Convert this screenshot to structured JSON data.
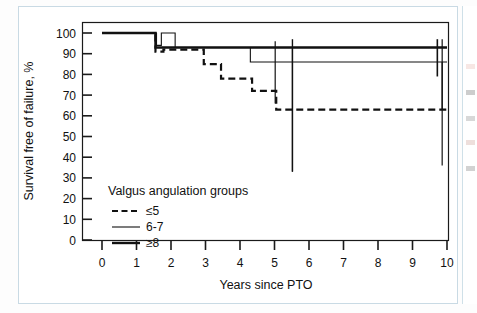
{
  "figure": {
    "name": "kaplan-meier-survival-plot"
  },
  "chart_data": {
    "type": "line",
    "title": "",
    "xlabel": "Years since PTO",
    "ylabel": "Survival free of failure, %",
    "xlim": [
      0,
      10
    ],
    "ylim": [
      0,
      100
    ],
    "xticks": [
      "0",
      "1",
      "2",
      "3",
      "4",
      "5",
      "6",
      "7",
      "8",
      "9",
      "10"
    ],
    "yticks": [
      "0",
      "10",
      "20",
      "30",
      "40",
      "50",
      "60",
      "70",
      "80",
      "90",
      "100"
    ],
    "grid": false,
    "legend_position": "lower-left-inside",
    "legend_title": "Valgus angulation groups",
    "series": [
      {
        "name": "≤5",
        "style": "dashed",
        "line_width": 2.2,
        "color": "#111111",
        "steps": [
          {
            "x": 0.0,
            "y": 100
          },
          {
            "x": 1.55,
            "y": 91
          },
          {
            "x": 1.78,
            "y": 92
          },
          {
            "x": 2.95,
            "y": 85
          },
          {
            "x": 3.45,
            "y": 78
          },
          {
            "x": 4.35,
            "y": 72
          },
          {
            "x": 5.05,
            "y": 63
          },
          {
            "x": 10.0,
            "y": 63
          }
        ]
      },
      {
        "name": "6-7",
        "style": "solid-thin",
        "line_width": 1.1,
        "color": "#111111",
        "steps": [
          {
            "x": 0.0,
            "y": 100
          },
          {
            "x": 1.58,
            "y": 94
          },
          {
            "x": 1.72,
            "y": 100
          },
          {
            "x": 2.12,
            "y": 93
          },
          {
            "x": 4.3,
            "y": 86
          },
          {
            "x": 10.0,
            "y": 86
          }
        ]
      },
      {
        "name": "≥8",
        "style": "solid-thick",
        "line_width": 2.4,
        "color": "#111111",
        "steps": [
          {
            "x": 0.0,
            "y": 100
          },
          {
            "x": 1.55,
            "y": 93
          },
          {
            "x": 10.0,
            "y": 93
          }
        ]
      }
    ],
    "censor_marks": [
      {
        "x": 5.02,
        "y_top": 96,
        "y_bottom": 66,
        "width": 1.2
      },
      {
        "x": 5.52,
        "y_top": 97,
        "y_bottom": 33,
        "width": 1.4
      },
      {
        "x": 5.52,
        "y_top": 93,
        "y_bottom": 33,
        "width": 1.2
      },
      {
        "x": 9.72,
        "y_top": 97,
        "y_bottom": 79,
        "width": 1.6
      },
      {
        "x": 9.86,
        "y_top": 97,
        "y_bottom": 63,
        "width": 1.2
      },
      {
        "x": 9.86,
        "y_top": 86,
        "y_bottom": 36,
        "width": 1.2
      }
    ]
  },
  "legend": {
    "title": "Valgus angulation groups",
    "items": [
      {
        "label": "≤5",
        "style": "dashed"
      },
      {
        "label": "6-7",
        "style": "solid-thin"
      },
      {
        "label": "≥8",
        "style": "solid-thick"
      }
    ]
  },
  "colors": {
    "line": "#111111",
    "axis": "#1a1a1a",
    "page_border": "#c9dae4",
    "background": "#ffffff"
  }
}
